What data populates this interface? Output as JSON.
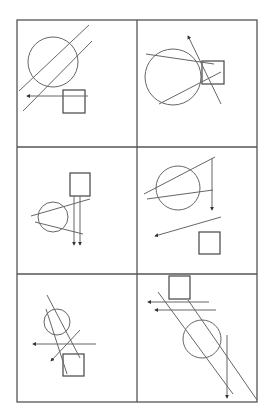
{
  "figure": {
    "title": "",
    "width": 272,
    "height": 408,
    "stroke_color": "#555555",
    "background": "#ffffff",
    "grid": {
      "columns": 2,
      "rows": 3,
      "x": [
        17,
        137,
        257
      ],
      "y": [
        20,
        147,
        274,
        402
      ]
    },
    "panels": [
      {
        "id": 1,
        "position": "row1-col1",
        "circle": {
          "cx": 53,
          "cy": 62,
          "r": 25
        },
        "square": {
          "x": 63,
          "y": 90,
          "w": 22,
          "h": 23
        },
        "lines": [
          {
            "x1": 19,
            "y1": 91,
            "x2": 89,
            "y2": 25
          },
          {
            "x1": 23,
            "y1": 111,
            "x2": 92,
            "y2": 41
          }
        ],
        "arrows": [
          {
            "x1": 88,
            "y1": 96,
            "x2": 27,
            "y2": 96,
            "direction": "left"
          }
        ]
      },
      {
        "id": 2,
        "position": "row1-col2",
        "circle": {
          "cx": 173,
          "cy": 77,
          "r": 28
        },
        "square": {
          "x": 202,
          "y": 61,
          "w": 22,
          "h": 23
        },
        "lines": [
          {
            "x1": 146,
            "y1": 54,
            "x2": 214,
            "y2": 64
          },
          {
            "x1": 159,
            "y1": 104,
            "x2": 221,
            "y2": 72
          }
        ],
        "arrows": [
          {
            "x1": 221,
            "y1": 104,
            "x2": 188,
            "y2": 36,
            "direction": "up-left"
          }
        ]
      },
      {
        "id": 3,
        "position": "row2-col1",
        "circle": {
          "cx": 53,
          "cy": 217,
          "r": 15
        },
        "square": {
          "x": 70,
          "y": 173,
          "w": 20,
          "h": 23
        },
        "lines": [
          {
            "x1": 31,
            "y1": 216,
            "x2": 90,
            "y2": 199
          },
          {
            "x1": 35,
            "y1": 222,
            "x2": 83,
            "y2": 234
          }
        ],
        "arrows": [
          {
            "x1": 74,
            "y1": 196,
            "x2": 74,
            "y2": 245,
            "direction": "down"
          },
          {
            "x1": 80,
            "y1": 196,
            "x2": 80,
            "y2": 245,
            "direction": "down"
          }
        ]
      },
      {
        "id": 4,
        "position": "row2-col2",
        "circle": {
          "cx": 178,
          "cy": 188,
          "r": 22
        },
        "square": {
          "x": 199,
          "y": 232,
          "w": 21,
          "h": 22
        },
        "lines": [
          {
            "x1": 144,
            "y1": 194,
            "x2": 215,
            "y2": 157
          },
          {
            "x1": 147,
            "y1": 199,
            "x2": 213,
            "y2": 190
          }
        ],
        "arrows": [
          {
            "x1": 212,
            "y1": 158,
            "x2": 212,
            "y2": 210,
            "direction": "down"
          },
          {
            "x1": 221,
            "y1": 217,
            "x2": 155,
            "y2": 236,
            "direction": "left"
          }
        ]
      },
      {
        "id": 5,
        "position": "row3-col1",
        "circle": {
          "cx": 57,
          "cy": 322,
          "r": 13
        },
        "square": {
          "x": 63,
          "y": 354,
          "w": 21,
          "h": 22
        },
        "lines": [
          {
            "x1": 47,
            "y1": 295,
            "x2": 80,
            "y2": 358
          },
          {
            "x1": 46,
            "y1": 309,
            "x2": 67,
            "y2": 374
          }
        ],
        "arrows": [
          {
            "x1": 96,
            "y1": 344,
            "x2": 33,
            "y2": 344,
            "direction": "left"
          },
          {
            "x1": 80,
            "y1": 330,
            "x2": 51,
            "y2": 361,
            "direction": "down-left"
          }
        ]
      },
      {
        "id": 6,
        "position": "row3-col2",
        "circle": {
          "cx": 202,
          "cy": 339,
          "r": 19
        },
        "square": {
          "x": 169,
          "y": 276,
          "w": 21,
          "h": 23
        },
        "lines": [
          {
            "x1": 158,
            "y1": 292,
            "x2": 233,
            "y2": 394
          },
          {
            "x1": 188,
            "y1": 300,
            "x2": 257,
            "y2": 400
          }
        ],
        "arrows": [
          {
            "x1": 209,
            "y1": 302,
            "x2": 148,
            "y2": 302,
            "direction": "left"
          },
          {
            "x1": 216,
            "y1": 310,
            "x2": 155,
            "y2": 310,
            "direction": "left"
          },
          {
            "x1": 227,
            "y1": 335,
            "x2": 227,
            "y2": 398,
            "direction": "down"
          }
        ]
      }
    ]
  }
}
